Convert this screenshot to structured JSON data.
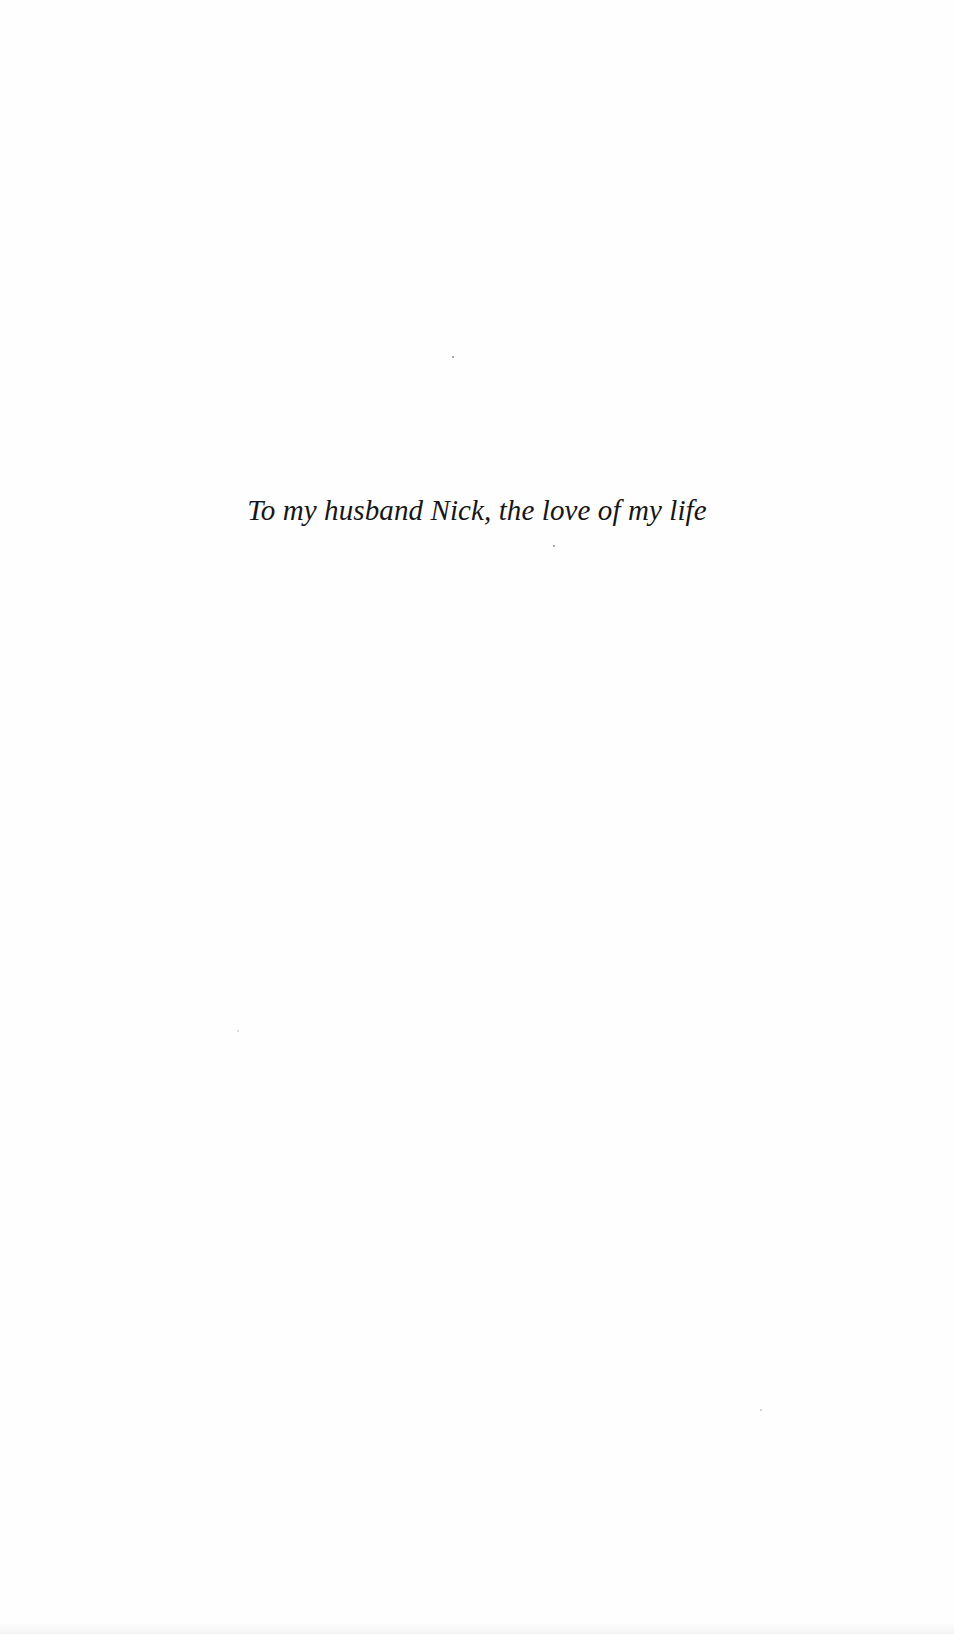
{
  "page": {
    "type": "book dedication page",
    "dedication_text": "To my husband Nick, the love of my life",
    "background_color": "#fefefe",
    "text_color": "#161616"
  }
}
